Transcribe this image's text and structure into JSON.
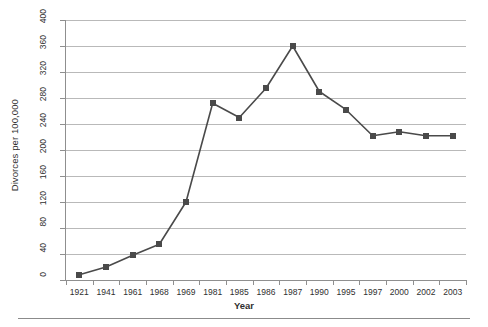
{
  "chart_data": {
    "type": "line",
    "title": "",
    "xlabel": "Year",
    "ylabel": "Divorces per 100,000",
    "categories": [
      "1921",
      "1941",
      "1961",
      "1968",
      "1969",
      "1981",
      "1985",
      "1986",
      "1987",
      "1990",
      "1995",
      "1997",
      "2000",
      "2002",
      "2003"
    ],
    "values": [
      8,
      20,
      38,
      55,
      120,
      272,
      250,
      295,
      360,
      290,
      262,
      222,
      228,
      222,
      222
    ],
    "series": [
      {
        "name": "Divorces per 100,000",
        "values": [
          8,
          20,
          38,
          55,
          120,
          272,
          250,
          295,
          360,
          290,
          262,
          222,
          228,
          222,
          222
        ]
      }
    ],
    "ylim": [
      0,
      400
    ],
    "ytick_values": [
      0,
      40,
      80,
      120,
      160,
      200,
      240,
      280,
      320,
      360,
      400
    ],
    "ytick_labels": [
      "0",
      "40",
      "80",
      "120",
      "160",
      "200",
      "240",
      "280",
      "320",
      "360",
      "400"
    ],
    "grid": true,
    "grid_axis": "y",
    "legend": false,
    "legend_position": "none",
    "marker": "square",
    "line_color": "#4a4a4a",
    "marker_color": "#4a4a4a",
    "grid_color": "#b9b9b9",
    "axis_color": "#8f8f8f",
    "background": "#ffffff",
    "ytick_label_rotation": 90
  }
}
